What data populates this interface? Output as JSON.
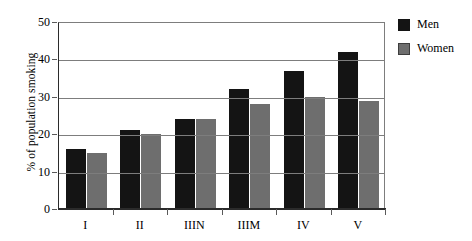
{
  "chart_data": {
    "type": "bar",
    "title": "",
    "subtitle": "",
    "xlabel": "",
    "ylabel": "% of population smoking",
    "categories": [
      "I",
      "II",
      "IIIN",
      "IIIM",
      "IV",
      "V"
    ],
    "series": [
      {
        "name": "Men",
        "color": "#141414",
        "values": [
          16,
          21,
          24,
          32,
          37,
          42
        ]
      },
      {
        "name": "Women",
        "color": "#6e6e6e",
        "values": [
          15,
          20,
          24,
          28,
          30,
          29
        ]
      }
    ],
    "ylim": [
      0,
      50
    ],
    "ytick_values": [
      0,
      10,
      20,
      30,
      40,
      50
    ],
    "ytick_labels": [
      "0",
      "10",
      "20",
      "30",
      "40",
      "50"
    ],
    "grid": true,
    "grid_axis": "y",
    "legend_position": "right",
    "annotations": []
  },
  "legend": {
    "items": [
      {
        "label": "Men",
        "swatch": "men"
      },
      {
        "label": "Women",
        "swatch": "women"
      }
    ]
  },
  "axes": {
    "y_title": "% of population smoking",
    "y_labels": [
      "50",
      "40",
      "30",
      "20",
      "10",
      "0"
    ],
    "x_labels": [
      "I",
      "II",
      "IIIN",
      "IIIM",
      "IV",
      "V"
    ]
  }
}
